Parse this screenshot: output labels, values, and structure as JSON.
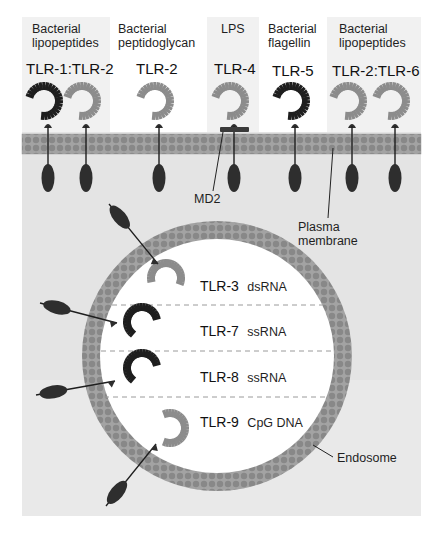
{
  "figure": {
    "type": "Toll-like receptor localization diagram",
    "colors": {
      "panel_bg": "#f1f1f1",
      "cytoplasm_bg": "#e2e2e2",
      "membrane_band": "#9a9a9a",
      "membrane_head": "#838383",
      "receptor_dark": "#1e1e1e",
      "receptor_light": "#8c8c8c",
      "tir_domain": "#2e2e2e",
      "endosome_lumen": "#ffffff",
      "dashed_divider": "#999999"
    }
  },
  "surface_receptors": [
    {
      "ligand_line1": "Bacterial",
      "ligand_line2": "lipopeptides",
      "name": "TLR-1:TLR-2"
    },
    {
      "ligand_line1": "Bacterial",
      "ligand_line2": "peptidoglycan",
      "name": "TLR-2"
    },
    {
      "ligand_line1": "LPS",
      "ligand_line2": "",
      "name": "TLR-4"
    },
    {
      "ligand_line1": "Bacterial",
      "ligand_line2": "flagellin",
      "name": "TLR-5"
    },
    {
      "ligand_line1": "Bacterial",
      "ligand_line2": "lipopeptides",
      "name": "TLR-2:TLR-6"
    }
  ],
  "annotations": {
    "md2": "MD2",
    "plasma_membrane_line1": "Plasma",
    "plasma_membrane_line2": "membrane",
    "endosome": "Endosome"
  },
  "endosomal_receptors": [
    {
      "name": "TLR-3",
      "ligand": "dsRNA"
    },
    {
      "name": "TLR-7",
      "ligand": "ssRNA"
    },
    {
      "name": "TLR-8",
      "ligand": "ssRNA"
    },
    {
      "name": "TLR-9",
      "ligand": "CpG DNA"
    }
  ]
}
